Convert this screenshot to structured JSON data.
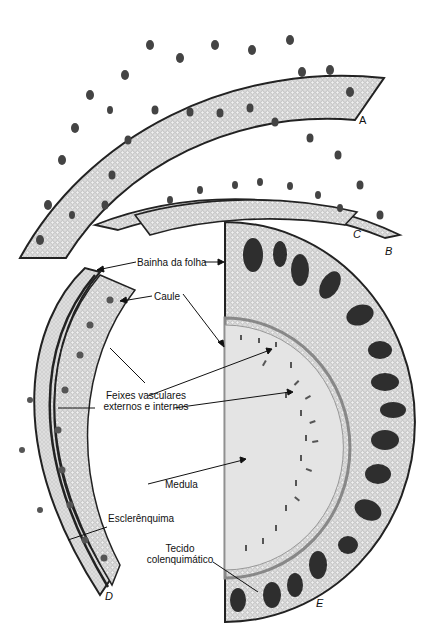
{
  "figure": {
    "panels": [
      {
        "id": "A",
        "letter": "A",
        "description": "Cross-section arc, largest"
      },
      {
        "id": "B",
        "letter": "B",
        "description": "Cross-section arc, medium"
      },
      {
        "id": "C",
        "letter": "C",
        "description": "Cross-section arc, small"
      },
      {
        "id": "D",
        "letter": "D",
        "description": "Leaf sheath and stem section"
      },
      {
        "id": "E",
        "letter": "E",
        "description": "Half stem cross-section with pith"
      }
    ],
    "labels": {
      "bainha": "Bainha da folha",
      "caule": "Caule",
      "feixes_line1": "Feixes vasculares",
      "feixes_line2": "externos e internos",
      "medula": "Medula",
      "esclerenquima": "Esclerênquima",
      "tecido_line1": "Tecido",
      "tecido_line2": "colenquimático"
    },
    "colors": {
      "tissue": "#d8d8d8",
      "tissue_light": "#e6e6e6",
      "edge": "#2a2a2a",
      "bundle": "#3a3a3a",
      "pith": "#e4e4e4"
    }
  }
}
